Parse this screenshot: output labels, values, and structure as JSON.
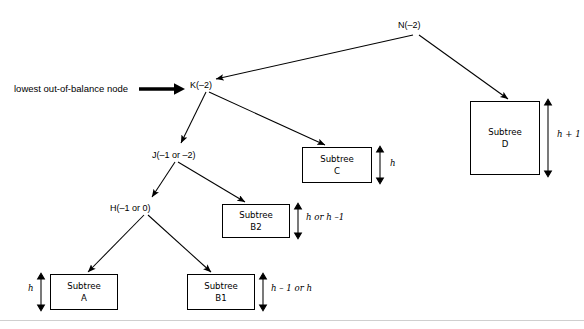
{
  "figure": {
    "caption_left": "lowest out-of-balance node",
    "nodes": [
      {
        "id": "N",
        "label": "N(–2)",
        "x": 398,
        "y": 20
      },
      {
        "id": "K",
        "label": "K(–2)",
        "x": 190,
        "y": 80
      },
      {
        "id": "J",
        "label": "J(–1 or –2)",
        "x": 152,
        "y": 150
      },
      {
        "id": "H",
        "label": "H(–1 or 0)",
        "x": 110,
        "y": 203
      }
    ],
    "boxes": [
      {
        "id": "D",
        "line1": "Subtree",
        "line2": "D",
        "x": 470,
        "y": 101,
        "w": 70,
        "h": 74
      },
      {
        "id": "C",
        "line1": "Subtree",
        "line2": "C",
        "x": 302,
        "y": 147,
        "w": 70,
        "h": 36
      },
      {
        "id": "B2",
        "line1": "Subtree",
        "line2": "B2",
        "x": 222,
        "y": 204,
        "w": 68,
        "h": 34
      },
      {
        "id": "A",
        "line1": "Subtree",
        "line2": "A",
        "x": 50,
        "y": 274,
        "w": 68,
        "h": 36
      },
      {
        "id": "B1",
        "line1": "Subtree",
        "line2": "B1",
        "x": 187,
        "y": 274,
        "w": 68,
        "h": 36
      }
    ],
    "height_labels": [
      {
        "id": "D",
        "text": "h + 1",
        "x": 557,
        "y": 134
      },
      {
        "id": "C",
        "text": "h",
        "x": 390,
        "y": 162
      },
      {
        "id": "B2",
        "text": "h or h –1",
        "x": 308,
        "y": 217
      },
      {
        "id": "A",
        "text": "h",
        "x": 30,
        "y": 288
      },
      {
        "id": "B1",
        "text": "h – 1 or h",
        "x": 273,
        "y": 288
      }
    ]
  },
  "colors": {
    "ink": "#000000",
    "paper": "#ffffff",
    "rule": "#cfcfcf"
  }
}
